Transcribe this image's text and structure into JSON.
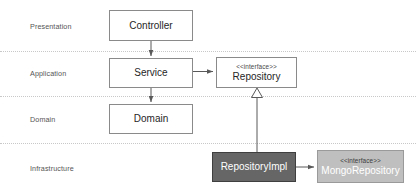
{
  "diagram": {
    "background_color": "#ffffff",
    "divider_color": "#c8c8c8",
    "layers": [
      {
        "name": "presentation",
        "label": "Presentation"
      },
      {
        "name": "application",
        "label": "Application"
      },
      {
        "name": "domain",
        "label": "Domain"
      },
      {
        "name": "infrastructure",
        "label": "Infrastructure"
      }
    ],
    "nodes": [
      {
        "name": "controller",
        "stereotype": "",
        "title": "Controller",
        "layer": "Presentation",
        "fill": "#ffffff",
        "border": "#8a8a8a",
        "text_color": "#262626"
      },
      {
        "name": "service",
        "stereotype": "",
        "title": "Service",
        "layer": "Application",
        "fill": "#ffffff",
        "border": "#8a8a8a",
        "text_color": "#262626"
      },
      {
        "name": "repository",
        "stereotype": "<<interface>>",
        "title": "Repository",
        "layer": "Application",
        "fill": "#ffffff",
        "border": "#8a8a8a",
        "text_color": "#262626"
      },
      {
        "name": "domain",
        "stereotype": "",
        "title": "Domain",
        "layer": "Domain",
        "fill": "#ffffff",
        "border": "#8a8a8a",
        "text_color": "#262626"
      },
      {
        "name": "repository-impl",
        "stereotype": "",
        "title": "RepositoryImpl",
        "layer": "Infrastructure",
        "fill": "#666666",
        "border": "#3f3f3f",
        "text_color": "#ffffff"
      },
      {
        "name": "mongo-repository",
        "stereotype": "<<interface>>",
        "title": "MongoRepository",
        "layer": "Infrastructure",
        "fill": "#bfbfbf",
        "border": "#9a9a9a",
        "text_color": "#ffffff"
      }
    ],
    "connectors": [
      {
        "name": "controller-to-service",
        "from": "Controller",
        "to": "Service",
        "kind": "dependency-arrow"
      },
      {
        "name": "service-to-repository",
        "from": "Service",
        "to": "Repository",
        "kind": "dependency-arrow"
      },
      {
        "name": "service-to-domain",
        "from": "Service",
        "to": "Domain",
        "kind": "dependency-arrow"
      },
      {
        "name": "repository-impl-implements-repository",
        "from": "RepositoryImpl",
        "to": "Repository",
        "kind": "realization-hollow-triangle"
      },
      {
        "name": "repository-impl-to-mongo-repository",
        "from": "RepositoryImpl",
        "to": "MongoRepository",
        "kind": "dependency-arrow"
      }
    ]
  }
}
